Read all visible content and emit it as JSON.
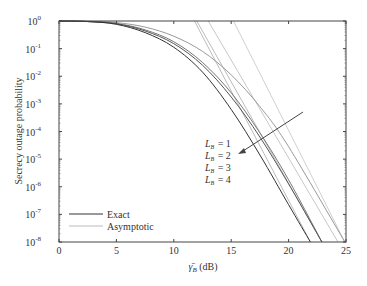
{
  "chart_data": {
    "type": "line",
    "title": "",
    "xlabel": "γ̄_B (dB)",
    "ylabel": "Secrecy outage probability",
    "xlim": [
      0,
      25
    ],
    "ylim": [
      1e-08,
      1
    ],
    "yscale": "log",
    "xticks": [
      0,
      5,
      10,
      15,
      20,
      25
    ],
    "yticks": [
      "10^0",
      "10^-1",
      "10^-2",
      "10^-3",
      "10^-4",
      "10^-5",
      "10^-6",
      "10^-7",
      "10^-8"
    ],
    "grid": false,
    "legend": {
      "position": "lower left",
      "entries": [
        {
          "label": "Exact",
          "style": "solid",
          "color": "#333333"
        },
        {
          "label": "Asymptotic",
          "style": "solid",
          "color": "#b0b0b0"
        }
      ]
    },
    "annotation": {
      "labels": [
        "L_B = 1",
        "L_B = 2",
        "L_B = 3",
        "L_B = 4"
      ],
      "arrow": "increasing L_B direction"
    },
    "series": [
      {
        "name": "Exact L_B=1",
        "kind": "exact",
        "color": "#333333",
        "x": [
          0,
          2.5,
          5,
          7.5,
          10,
          12.5,
          15,
          17.5,
          20,
          21.9
        ],
        "log10y": [
          0,
          -0.02,
          -0.12,
          -0.42,
          -0.95,
          -1.85,
          -3.2,
          -4.85,
          -6.65,
          -8
        ]
      },
      {
        "name": "Exact L_B=2",
        "kind": "exact",
        "color": "#555555",
        "x": [
          0,
          2.5,
          5,
          7.5,
          10,
          12.5,
          15,
          17.5,
          20,
          22.9
        ],
        "log10y": [
          0,
          -0.02,
          -0.1,
          -0.36,
          -0.82,
          -1.6,
          -2.75,
          -4.2,
          -5.9,
          -8
        ]
      },
      {
        "name": "Exact L_B=3",
        "kind": "exact",
        "color": "#777777",
        "x": [
          0,
          2.5,
          5,
          7.5,
          10,
          12.5,
          15,
          17.5,
          20,
          22.9
        ],
        "log10y": [
          0,
          -0.02,
          -0.09,
          -0.32,
          -0.75,
          -1.5,
          -2.6,
          -4.05,
          -5.75,
          -8
        ]
      },
      {
        "name": "Exact L_B=4",
        "kind": "exact",
        "color": "#999999",
        "x": [
          0,
          2.5,
          5,
          7.5,
          10,
          12.5,
          15,
          17.5,
          20,
          24.9
        ],
        "log10y": [
          0,
          -0.01,
          -0.06,
          -0.22,
          -0.55,
          -1.1,
          -1.95,
          -3.1,
          -4.55,
          -8
        ]
      },
      {
        "name": "Asymptotic L_B=1",
        "kind": "asymptotic",
        "color": "#bbbbbb",
        "x": [
          11.8,
          21.9
        ],
        "log10y": [
          0,
          -8
        ]
      },
      {
        "name": "Asymptotic L_B=2",
        "kind": "asymptotic",
        "color": "#bbbbbb",
        "x": [
          12.0,
          22.9
        ],
        "log10y": [
          0,
          -8
        ]
      },
      {
        "name": "Asymptotic L_B=3",
        "kind": "asymptotic",
        "color": "#c8c8c8",
        "x": [
          13.0,
          24.3
        ],
        "log10y": [
          0,
          -8
        ]
      },
      {
        "name": "Asymptotic L_B=4",
        "kind": "asymptotic",
        "color": "#d0d0d0",
        "x": [
          15.2,
          24.9
        ],
        "log10y": [
          0,
          -8
        ]
      }
    ]
  },
  "axes": {
    "xlabel_symbol": "γ̄",
    "xlabel_sub": "B",
    "xlabel_unit": " (dB)",
    "ylabel": "Secrecy outage probability"
  },
  "legend": {
    "exact": "Exact",
    "asymptotic": "Asymptotic"
  },
  "annotation": {
    "prefix": "L",
    "sub": "B",
    "labels": [
      "= 1",
      "= 2",
      "= 3",
      "= 4"
    ]
  }
}
